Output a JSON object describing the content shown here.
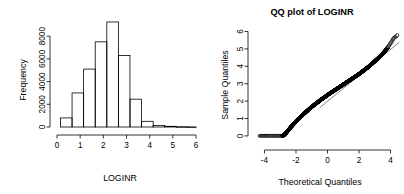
{
  "figure": {
    "background": "#ffffff",
    "width": 404,
    "height": 194,
    "foreground": "#000000"
  },
  "chart_data": [
    {
      "type": "bar",
      "subtype": "histogram",
      "title": "",
      "xlabel": "LOGINR",
      "ylabel": "Frequency",
      "xlim": [
        0,
        6
      ],
      "ylim": [
        0,
        9600
      ],
      "xticks": [
        0,
        1,
        2,
        3,
        4,
        5,
        6
      ],
      "xtick_labels": [
        "0",
        "1",
        "2",
        "3",
        "4",
        "5",
        "6"
      ],
      "yticks": [
        0,
        2000,
        4000,
        6000,
        8000
      ],
      "ytick_labels": [
        "0",
        "2000",
        "4000",
        "6000",
        "8000"
      ],
      "grid": false,
      "legend": false,
      "binwidth": 0.5,
      "bin_edges": [
        0.15,
        0.65,
        1.15,
        1.65,
        2.15,
        2.65,
        3.15,
        3.65,
        4.15,
        4.65,
        5.15,
        5.65,
        6.0
      ],
      "categories": [
        "0.15-0.65",
        "0.65-1.15",
        "1.15-1.65",
        "1.65-2.15",
        "2.15-2.65",
        "2.65-3.15",
        "3.15-3.65",
        "3.65-4.15",
        "4.15-4.65",
        "4.65-5.15",
        "5.15-5.65",
        "5.65-6.0"
      ],
      "values": [
        800,
        3000,
        5100,
        7500,
        9250,
        6300,
        2450,
        500,
        130,
        60,
        25,
        10
      ],
      "bar_fill": "#ffffff",
      "bar_stroke": "#000000"
    },
    {
      "type": "scatter",
      "subtype": "qq-plot",
      "title": "QQ plot of LOGINR",
      "xlabel": "Theoretical Quantiles",
      "ylabel": "Sample Quantiles",
      "xlim": [
        -4.6,
        4.6
      ],
      "ylim": [
        -0.35,
        6.2
      ],
      "xticks": [
        -4,
        -2,
        0,
        2,
        4
      ],
      "xtick_labels": [
        "-4",
        "-2",
        "0",
        "2",
        "4"
      ],
      "yticks": [
        0,
        1,
        2,
        3,
        4,
        5,
        6
      ],
      "ytick_labels": [
        "0",
        "1",
        "2",
        "3",
        "4",
        "5",
        "6"
      ],
      "grid": false,
      "legend": false,
      "point_color": "#000000",
      "reference_line": {
        "x": [
          2.1,
          4.45
        ],
        "y": [
          3.55,
          5.3
        ],
        "color": "#000000"
      },
      "x": [
        -4.3,
        -4.15,
        -4.02,
        -3.9,
        -3.78,
        -3.62,
        -3.45,
        -3.3,
        -3.15,
        -3.0,
        -2.88,
        -2.8,
        -2.7,
        -2.6,
        -2.5,
        -2.4,
        -2.3,
        -2.2,
        -2.1,
        -2.0,
        -1.9,
        -1.8,
        -1.7,
        -1.6,
        -1.5,
        -1.4,
        -1.3,
        -1.2,
        -1.1,
        -1.0,
        -0.9,
        -0.8,
        -0.7,
        -0.6,
        -0.5,
        -0.4,
        -0.3,
        -0.2,
        -0.1,
        0.0,
        0.1,
        0.2,
        0.3,
        0.4,
        0.5,
        0.6,
        0.7,
        0.8,
        0.9,
        1.0,
        1.1,
        1.2,
        1.3,
        1.4,
        1.5,
        1.6,
        1.7,
        1.8,
        1.9,
        2.0,
        2.1,
        2.2,
        2.3,
        2.4,
        2.5,
        2.6,
        2.7,
        2.8,
        2.9,
        3.0,
        3.1,
        3.2,
        3.3,
        3.4,
        3.5,
        3.6,
        3.7,
        3.8,
        3.9,
        4.0,
        4.1,
        4.2,
        4.35,
        4.45
      ],
      "y": [
        0.0,
        0.0,
        0.0,
        0.0,
        0.0,
        0.0,
        0.0,
        0.0,
        0.0,
        0.0,
        0.0,
        0.02,
        0.1,
        0.2,
        0.31,
        0.42,
        0.53,
        0.63,
        0.73,
        0.83,
        0.92,
        1.01,
        1.1,
        1.19,
        1.27,
        1.35,
        1.43,
        1.51,
        1.59,
        1.67,
        1.74,
        1.81,
        1.88,
        1.95,
        2.02,
        2.09,
        2.15,
        2.22,
        2.28,
        2.35,
        2.41,
        2.47,
        2.53,
        2.59,
        2.65,
        2.71,
        2.77,
        2.83,
        2.89,
        2.95,
        3.01,
        3.07,
        3.13,
        3.19,
        3.25,
        3.31,
        3.37,
        3.43,
        3.49,
        3.55,
        3.62,
        3.69,
        3.76,
        3.83,
        3.9,
        3.97,
        4.05,
        4.13,
        4.21,
        4.29,
        4.37,
        4.45,
        4.54,
        4.63,
        4.72,
        4.82,
        4.93,
        5.05,
        5.18,
        5.32,
        5.47,
        5.62,
        5.72,
        5.8
      ]
    }
  ]
}
